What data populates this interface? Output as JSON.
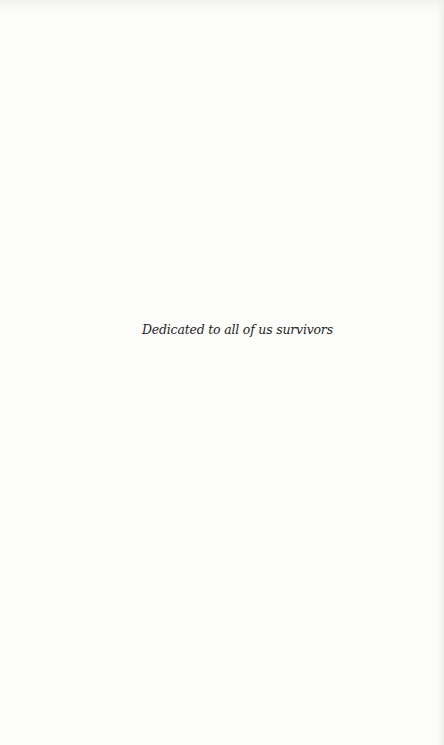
{
  "page": {
    "dedication": "Dedicated to all of us survivors",
    "background_color": "#fbfbfa",
    "text_color": "#1e1e1e"
  }
}
